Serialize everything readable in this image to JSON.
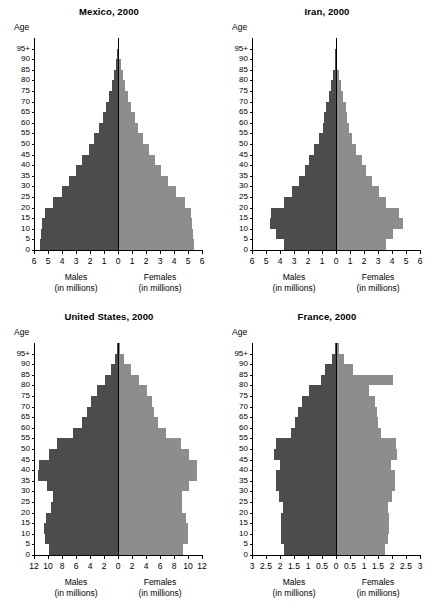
{
  "figure": {
    "age_axis_caption": "Age",
    "male_label": "Males",
    "male_units": "(in millions)",
    "female_label": "Females",
    "female_units": "(in millions)",
    "male_color": "#4c4c4c",
    "female_color": "#8d8d8d",
    "age_tick_labels": [
      "0",
      "5",
      "10",
      "15",
      "20",
      "25",
      "30",
      "35",
      "40",
      "45",
      "50",
      "55",
      "60",
      "65",
      "70",
      "75",
      "80",
      "85",
      "90",
      "95+"
    ]
  },
  "chart_data": [
    {
      "type": "bar",
      "title": "Mexico, 2000",
      "xlabel": "",
      "ylabel": "Age",
      "xlim": [
        -6,
        6
      ],
      "xticks": [
        -6,
        -5,
        -4,
        -3,
        -2,
        -1,
        0,
        1,
        2,
        3,
        4,
        5,
        6
      ],
      "xtick_labels": [
        "6",
        "5",
        "4",
        "3",
        "2",
        "1",
        "0",
        "1",
        "2",
        "3",
        "4",
        "5",
        "6"
      ],
      "grid": false,
      "legend": "none",
      "age_groups": [
        "0-4",
        "5-9",
        "10-14",
        "15-19",
        "20-24",
        "25-29",
        "30-34",
        "35-39",
        "40-44",
        "45-49",
        "50-54",
        "55-59",
        "60-64",
        "65-69",
        "70-74",
        "75-79",
        "80-84",
        "85-89",
        "90-94",
        "95+"
      ],
      "series": [
        {
          "name": "Males (in millions)",
          "values": [
            5.55,
            5.5,
            5.45,
            5.25,
            4.65,
            4.0,
            3.5,
            3.0,
            2.55,
            2.1,
            1.7,
            1.35,
            1.1,
            0.85,
            0.62,
            0.42,
            0.28,
            0.15,
            0.07,
            0.03
          ]
        },
        {
          "name": "Females (in millions)",
          "values": [
            5.4,
            5.35,
            5.3,
            5.2,
            4.75,
            4.15,
            3.6,
            3.1,
            2.65,
            2.2,
            1.8,
            1.45,
            1.2,
            0.95,
            0.7,
            0.5,
            0.34,
            0.19,
            0.09,
            0.04
          ]
        }
      ]
    },
    {
      "type": "bar",
      "title": "Iran, 2000",
      "xlabel": "",
      "ylabel": "Age",
      "xlim": [
        -6,
        6
      ],
      "xticks": [
        -6,
        -5,
        -4,
        -3,
        -2,
        -1,
        0,
        1,
        2,
        3,
        4,
        5,
        6
      ],
      "xtick_labels": [
        "6",
        "5",
        "4",
        "3",
        "2",
        "1",
        "0",
        "1",
        "2",
        "3",
        "4",
        "5",
        "6"
      ],
      "grid": false,
      "legend": "none",
      "age_groups": [
        "0-4",
        "5-9",
        "10-14",
        "15-19",
        "20-24",
        "25-29",
        "30-34",
        "35-39",
        "40-44",
        "45-49",
        "50-54",
        "55-59",
        "60-64",
        "65-69",
        "70-74",
        "75-79",
        "80-84",
        "85-89",
        "90-94",
        "95+"
      ],
      "series": [
        {
          "name": "Males (in millions)",
          "values": [
            3.75,
            4.3,
            4.75,
            4.65,
            3.7,
            3.15,
            2.65,
            2.25,
            1.95,
            1.55,
            1.2,
            0.95,
            0.85,
            0.7,
            0.52,
            0.34,
            0.2,
            0.1,
            0.04,
            0.02
          ]
        },
        {
          "name": "Females (in millions)",
          "values": [
            3.55,
            4.1,
            4.75,
            4.5,
            3.55,
            3.05,
            2.55,
            2.15,
            1.85,
            1.45,
            1.15,
            0.92,
            0.82,
            0.68,
            0.5,
            0.33,
            0.2,
            0.1,
            0.04,
            0.02
          ]
        }
      ]
    },
    {
      "type": "bar",
      "title": "United States, 2000",
      "xlabel": "",
      "ylabel": "Age",
      "xlim": [
        -12,
        12
      ],
      "xticks": [
        -12,
        -10,
        -8,
        -6,
        -4,
        -2,
        0,
        2,
        4,
        6,
        8,
        10,
        12
      ],
      "xtick_labels": [
        "12",
        "10",
        "8",
        "6",
        "4",
        "2",
        "0",
        "2",
        "4",
        "6",
        "8",
        "10",
        "12"
      ],
      "grid": false,
      "legend": "none",
      "age_groups": [
        "0-4",
        "5-9",
        "10-14",
        "15-19",
        "20-24",
        "25-29",
        "30-34",
        "35-39",
        "40-44",
        "45-49",
        "50-54",
        "55-59",
        "60-64",
        "65-69",
        "70-74",
        "75-79",
        "80-84",
        "85-89",
        "90-94",
        "95+"
      ],
      "series": [
        {
          "name": "Males (in millions)",
          "values": [
            9.8,
            10.5,
            10.55,
            10.25,
            9.6,
            9.3,
            10.2,
            11.4,
            11.3,
            9.9,
            8.7,
            6.5,
            5.2,
            4.5,
            3.9,
            2.95,
            1.9,
            1.0,
            0.4,
            0.12
          ]
        },
        {
          "name": "Females (in millions)",
          "values": [
            9.35,
            10.0,
            10.05,
            9.75,
            9.2,
            9.15,
            10.1,
            11.35,
            11.35,
            10.1,
            9.0,
            6.9,
            5.7,
            5.2,
            4.9,
            4.1,
            3.0,
            1.85,
            0.85,
            0.28
          ]
        }
      ]
    },
    {
      "type": "bar",
      "title": "France, 2000",
      "xlabel": "",
      "ylabel": "Age",
      "xlim": [
        -3,
        3
      ],
      "xticks": [
        -3,
        -2.5,
        -2,
        -1.5,
        -1,
        -0.5,
        0,
        0.5,
        1,
        1.5,
        2,
        2.5,
        3
      ],
      "xtick_labels": [
        "3",
        "2.5",
        "2",
        "1.5",
        "1",
        "0.5",
        "0",
        "0.5",
        "1",
        "1.5",
        "2",
        "2.5",
        "3"
      ],
      "grid": false,
      "legend": "none",
      "age_groups": [
        "0-4",
        "5-9",
        "10-14",
        "15-19",
        "20-24",
        "25-29",
        "30-34",
        "35-39",
        "40-44",
        "45-49",
        "50-54",
        "55-59",
        "60-64",
        "65-69",
        "70-74",
        "75-79",
        "80-84",
        "85-89",
        "90-94",
        "95+"
      ],
      "series": [
        {
          "name": "Males (in millions)",
          "values": [
            1.85,
            1.95,
            1.98,
            1.95,
            1.9,
            2.05,
            2.15,
            2.15,
            2.0,
            2.2,
            2.15,
            1.6,
            1.45,
            1.35,
            1.2,
            0.95,
            0.52,
            0.38,
            0.14,
            0.04
          ]
        },
        {
          "name": "Females (in millions)",
          "values": [
            1.75,
            1.85,
            1.9,
            1.88,
            1.85,
            2.0,
            2.1,
            2.12,
            1.98,
            2.18,
            2.15,
            1.62,
            1.5,
            1.45,
            1.38,
            1.18,
            2.05,
            0.62,
            0.3,
            0.1
          ]
        }
      ]
    }
  ]
}
